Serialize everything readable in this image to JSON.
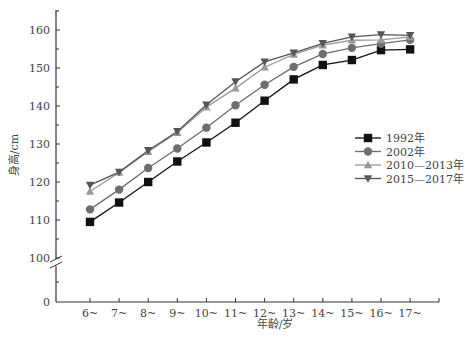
{
  "chart_data": {
    "type": "line",
    "title": "",
    "xlabel": "年龄/岁",
    "ylabel": "身高/cm",
    "categories": [
      "6~",
      "7~",
      "8~",
      "9~",
      "10~",
      "11~",
      "12~",
      "13~",
      "14~",
      "15~",
      "16~",
      "17~"
    ],
    "y_ticks": [
      0,
      100,
      110,
      120,
      130,
      140,
      150,
      160
    ],
    "y_tick_labels": [
      "0",
      "100",
      "110",
      "120",
      "130",
      "140",
      "150",
      "160"
    ],
    "ylim_upper": [
      100,
      165
    ],
    "y_axis_break": "between 0 and 100",
    "grid": false,
    "legend_position": "right",
    "series": [
      {
        "name": "1992年",
        "marker": "square",
        "color": "#111111",
        "values": [
          109.5,
          114.6,
          120.0,
          125.4,
          130.4,
          135.6,
          141.4,
          147.0,
          150.8,
          152.1,
          154.7,
          154.9
        ]
      },
      {
        "name": "2002年",
        "marker": "circle",
        "color": "#6e6e6e",
        "values": [
          112.8,
          118.0,
          123.7,
          128.8,
          134.3,
          140.2,
          145.6,
          150.3,
          153.7,
          155.3,
          156.4,
          157.4
        ]
      },
      {
        "name": "2010—2013年",
        "marker": "triangle-up",
        "color": "#9a9a9a",
        "values": [
          117.5,
          122.5,
          128.0,
          133.0,
          139.7,
          144.7,
          150.2,
          153.6,
          156.0,
          157.3,
          157.4,
          158.2
        ]
      },
      {
        "name": "2015—2017年",
        "marker": "triangle-down",
        "color": "#555555",
        "values": [
          119.2,
          122.6,
          128.3,
          133.3,
          140.3,
          146.4,
          151.6,
          154.0,
          156.5,
          158.2,
          158.8,
          158.6
        ]
      }
    ]
  }
}
